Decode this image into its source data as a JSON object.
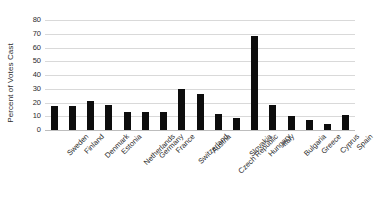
{
  "chart_data": {
    "type": "bar",
    "title": "",
    "subtitle": "",
    "xlabel": "",
    "ylabel": "Percent of Votes Cast",
    "ylim": [
      0,
      80
    ],
    "ytick_step": 10,
    "yticks": [
      0,
      10,
      20,
      30,
      40,
      50,
      60,
      70,
      80
    ],
    "grid": true,
    "legend": false,
    "legend_position": "none",
    "bar_color": "#0d0d0d",
    "gridline_color": "#d9d9d9",
    "categories": [
      "Sweden",
      "Finland",
      "Denmark",
      "Estonia",
      "Netherlands",
      "Germany",
      "France",
      "Switzerland",
      "Austria",
      "Czech Republic",
      "Slovakia",
      "Hungary",
      "Italy",
      "Bulgaria",
      "Greece",
      "Cyprus",
      "Spain"
    ],
    "values": [
      17.5,
      17.5,
      21,
      18,
      13,
      12.8,
      13.2,
      29.5,
      26.5,
      11.5,
      8.8,
      68.5,
      18,
      10,
      7.5,
      4.5,
      11
    ]
  }
}
